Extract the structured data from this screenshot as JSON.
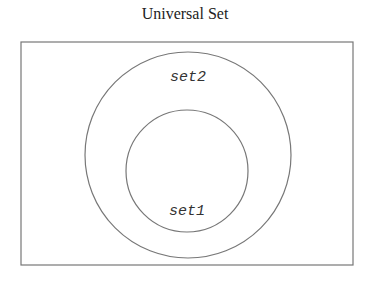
{
  "diagram": {
    "title": "Universal Set",
    "type": "venn",
    "sets": [
      {
        "name": "set2",
        "contains": [
          "set1"
        ]
      },
      {
        "name": "set1",
        "subset_of": "set2"
      }
    ],
    "labels": {
      "outer": "set2",
      "inner": "set1"
    },
    "colors": {
      "stroke": "#777777",
      "background": "#ffffff"
    }
  }
}
